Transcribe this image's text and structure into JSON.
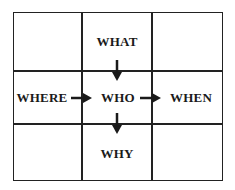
{
  "diagram": {
    "type": "3x3 grid",
    "cells": {
      "top_center": "WHAT",
      "middle_left": "WHERE",
      "middle_center": "WHO",
      "middle_right": "WHEN",
      "bottom_center": "WHY"
    },
    "arrows": [
      {
        "from": "WHAT",
        "to": "WHO",
        "direction": "down"
      },
      {
        "from": "WHERE",
        "to": "WHO",
        "direction": "right"
      },
      {
        "from": "WHO",
        "to": "WHEN",
        "direction": "right"
      },
      {
        "from": "WHO",
        "to": "WHY",
        "direction": "down"
      }
    ],
    "line_color": "#222222",
    "text_color": "#1a1a1a"
  }
}
